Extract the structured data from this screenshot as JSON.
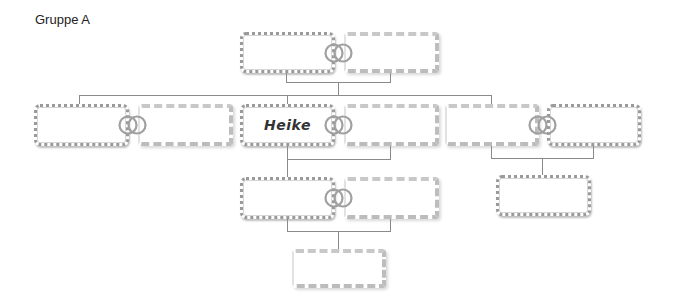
{
  "title": "Gruppe A",
  "colors": {
    "line": "#8a8a8a",
    "ring": "#9a9a9a",
    "zigzag_border": "#9a9a9a",
    "stripe_border": "#c8c8c8"
  },
  "icons": {
    "rings": "wedding-rings-icon"
  },
  "tree": {
    "row1": {
      "couple": [
        {
          "name": "",
          "style": "zigzag"
        },
        {
          "name": "",
          "style": "stripe"
        }
      ]
    },
    "row2": [
      {
        "couple": [
          {
            "name": "",
            "style": "zigzag"
          },
          {
            "name": "",
            "style": "stripe"
          }
        ]
      },
      {
        "couple": [
          {
            "name": "Heike",
            "style": "zigzag"
          },
          {
            "name": "",
            "style": "stripe"
          }
        ]
      },
      {
        "couple": [
          {
            "name": "",
            "style": "stripe"
          },
          {
            "name": "",
            "style": "zigzag"
          }
        ]
      }
    ],
    "row3": [
      {
        "couple": [
          {
            "name": "",
            "style": "zigzag"
          },
          {
            "name": "",
            "style": "stripe"
          }
        ]
      },
      {
        "single": {
          "name": "",
          "style": "zigzag"
        }
      }
    ],
    "row4": [
      {
        "single": {
          "name": "",
          "style": "stripe"
        }
      }
    ]
  }
}
